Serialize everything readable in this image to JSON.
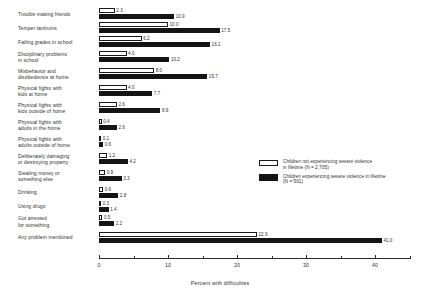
{
  "chart_data": {
    "type": "bar",
    "orientation": "horizontal",
    "title": "",
    "xlabel": "Percent with difficulties",
    "ylabel": "",
    "xlim": [
      0,
      45
    ],
    "xticks": [
      0,
      10,
      20,
      30,
      40
    ],
    "xticklabels": [
      "0",
      "10",
      "20",
      "30",
      "40"
    ],
    "grid": false,
    "legend_position": "middle-right",
    "categories": [
      "Trouble making friends",
      "Temper tantrums",
      "Failing grades in school",
      "Disciplinary problems\nin school",
      "Misbehavior and\ndisobedience at home",
      "Physical fights with\nkids at home",
      "Physical fights with\nkids outside of home",
      "Physical fights with\nadults in the home",
      "Physical fights with\nadults outside of home",
      "Deliberately damaging\nor destroying property",
      "Stealing money or\nsomething else",
      "Drinking",
      "Using drugs",
      "Got arrested\nfor something",
      "Any problem mentioned"
    ],
    "series": [
      {
        "name": "Children not experiencing severe violence in lifetime (N = 2,705)",
        "color": "#ffffff",
        "values": [
          2.3,
          10.0,
          6.2,
          4.0,
          8.0,
          4.0,
          2.6,
          0.4,
          0.1,
          1.2,
          0.9,
          0.6,
          0.3,
          0.5,
          22.9
        ],
        "labels": [
          "2.3",
          "10.0",
          "6.2",
          "4.0",
          "8.0",
          "4.0",
          "2.6",
          "0.4",
          "0.1",
          "1.2",
          "0.9",
          "0.6",
          "0.3",
          "0.5",
          "22.9"
        ]
      },
      {
        "name": "Children experiencing severe violence in lifetime (N = 501)",
        "color": "#141414",
        "values": [
          10.9,
          17.5,
          16.1,
          10.2,
          15.7,
          7.7,
          8.9,
          2.6,
          0.6,
          4.2,
          3.3,
          2.8,
          1.4,
          2.2,
          41.0
        ],
        "labels": [
          "10.9",
          "17.5",
          "16.1",
          "10.2",
          "15.7",
          "7.7",
          "8.9",
          "2.6",
          "0.6",
          "4.2",
          "3.3",
          "2.8",
          "1.4",
          "2.2",
          "41.0"
        ]
      }
    ]
  },
  "legend": {
    "entries": [
      {
        "swatch": "light",
        "text": "Children not experiencing severe violence\nin lifetime (N = 2,705)"
      },
      {
        "swatch": "dark",
        "text": "Children experiencing severe violence in lifetime\n(N = 501)"
      }
    ]
  },
  "axis": {
    "label": "Percent with difficulties"
  }
}
